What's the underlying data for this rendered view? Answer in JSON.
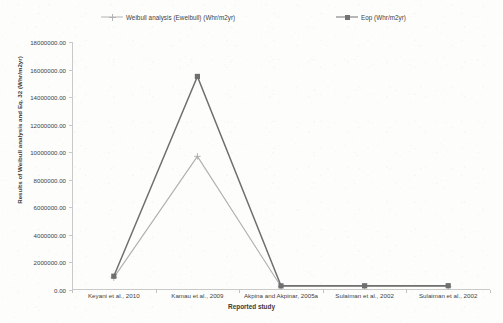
{
  "chart_data": {
    "type": "line",
    "title": "",
    "xlabel": "Reported study",
    "ylabel": "Results of Weibull analysis and Eq. 32 (Whr/m2yr)",
    "categories": [
      "Keyani et al., 2010",
      "Kamau et al., 2009",
      "Akpina and Akpinar, 2005a",
      "Sulaiman et al., 2002",
      "Sulaiman et al., 2002"
    ],
    "series": [
      {
        "name": "Weibull analysis (Eweibull) (Whr/m2yr)",
        "marker": "cross",
        "color": "#b0b0b0",
        "values": [
          900000,
          9700000,
          250000,
          260000,
          265000
        ]
      },
      {
        "name": "Eop (Whr/m2yr)",
        "marker": "square",
        "color": "#6f6f6f",
        "values": [
          1000000,
          15500000,
          300000,
          305000,
          310000
        ]
      }
    ],
    "ylim": [
      0,
      18000000
    ],
    "ytick_step": 2000000,
    "ytick_labels": [
      "18000000.00",
      "16000000.00",
      "14000000.00",
      "12000000.00",
      "10000000.00",
      "8000000.00",
      "6000000.00",
      "4000000.00",
      "2000000.00",
      "0.00"
    ],
    "grid": false,
    "legend_position": "top"
  },
  "legend": {
    "weibull_label": "Weibull analysis (Eweibull) (Whr/m2yr)",
    "eop_label": "Eop (Whr/m2yr)"
  },
  "axes": {
    "y_title": "Results of Weibull analysis and Eq. 32 (Whr/m2yr)",
    "x_title": "Reported study"
  }
}
